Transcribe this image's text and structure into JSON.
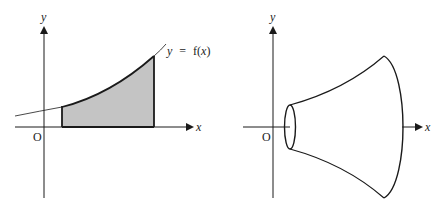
{
  "left_figure": {
    "y_axis_label": "y",
    "x_axis_label": "x",
    "origin_label": "O",
    "curve_label_y": "y",
    "curve_label_eq": "=",
    "curve_label_f": "f(",
    "curve_label_x": "x",
    "curve_label_close": ")",
    "shaded_color": "#c4c4c4"
  },
  "right_figure": {
    "y_axis_label": "y",
    "x_axis_label": "x",
    "origin_label": "O"
  },
  "colors": {
    "line": "#1a1a1a",
    "shade": "#c4c4c4",
    "background": "#ffffff"
  }
}
